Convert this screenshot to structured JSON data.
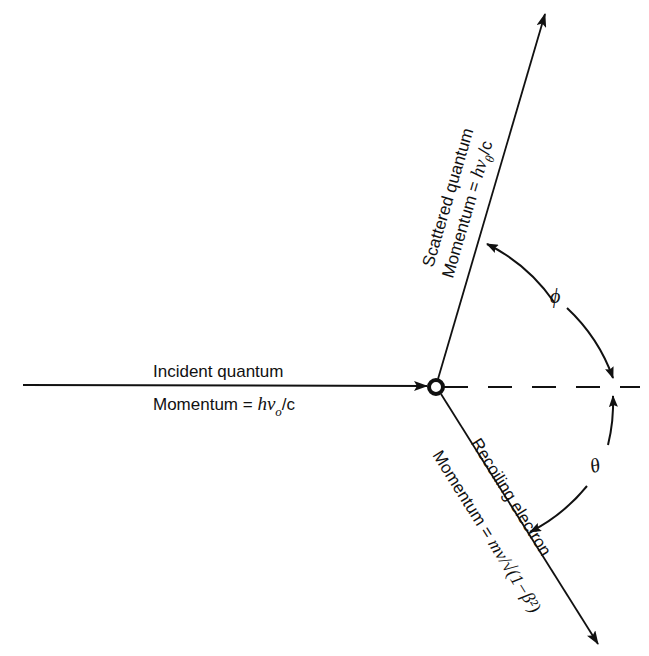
{
  "diagram": {
    "incident": {
      "label": "Incident quantum",
      "momentum_prefix": "Momentum = ",
      "momentum_expr": "hν",
      "momentum_sub": "o",
      "momentum_suffix": "/c"
    },
    "scattered": {
      "label": "Scattered quantum",
      "momentum_prefix": "Momentum = ",
      "momentum_expr": "hν",
      "momentum_sub": "θ",
      "momentum_suffix": "/c"
    },
    "recoil": {
      "label": "Recoiling electron",
      "momentum_prefix": "Momentum = ",
      "momentum_expr": "mv/√(1−β²)"
    },
    "angles": {
      "phi": "ϕ",
      "theta": "θ"
    },
    "colors": {
      "line": "#111111",
      "background": "#ffffff"
    }
  }
}
